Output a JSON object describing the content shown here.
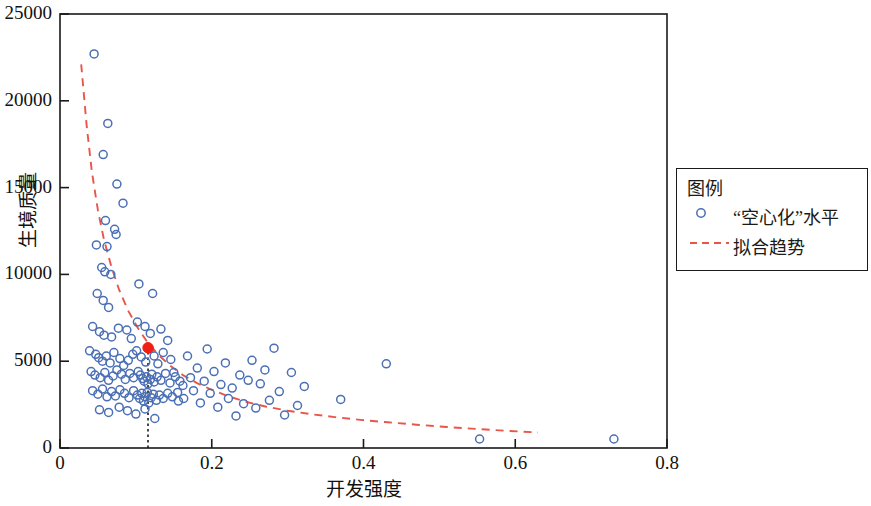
{
  "chart_data": {
    "type": "scatter",
    "title": "",
    "xlabel": "开发强度",
    "ylabel": "生境质量",
    "xlim": [
      0,
      0.8
    ],
    "ylim": [
      0,
      25000
    ],
    "grid": false,
    "xticks": [
      "0",
      "0.2",
      "0.4",
      "0.6",
      "0.8"
    ],
    "xtick_values": [
      0,
      0.2,
      0.4,
      0.6,
      0.8
    ],
    "yticks": [
      "0",
      "5000",
      "10000",
      "15000",
      "20000",
      "25000"
    ],
    "ytick_values": [
      0,
      5000,
      10000,
      15000,
      20000,
      25000
    ],
    "legend": {
      "title": "图例",
      "position": "right-outside",
      "entries": [
        {
          "label": "“空心化”水平",
          "marker": "open-circle",
          "color": "#4a6fb5"
        },
        {
          "label": "拟合趋势",
          "marker": "dashed-line",
          "color": "#e8564a"
        }
      ]
    },
    "series": [
      {
        "name": "“空心化”水平",
        "type": "scatter",
        "marker": "open-circle",
        "color": "#4a6fb5",
        "points": [
          [
            0.045,
            22700
          ],
          [
            0.063,
            18700
          ],
          [
            0.057,
            16900
          ],
          [
            0.075,
            15200
          ],
          [
            0.083,
            14100
          ],
          [
            0.06,
            13100
          ],
          [
            0.072,
            12600
          ],
          [
            0.074,
            12300
          ],
          [
            0.048,
            11700
          ],
          [
            0.062,
            11600
          ],
          [
            0.055,
            10400
          ],
          [
            0.059,
            10150
          ],
          [
            0.067,
            10000
          ],
          [
            0.049,
            8900
          ],
          [
            0.057,
            8500
          ],
          [
            0.064,
            8100
          ],
          [
            0.104,
            9450
          ],
          [
            0.122,
            8900
          ],
          [
            0.043,
            7000
          ],
          [
            0.052,
            6700
          ],
          [
            0.058,
            6500
          ],
          [
            0.068,
            6400
          ],
          [
            0.077,
            6900
          ],
          [
            0.088,
            6800
          ],
          [
            0.094,
            6300
          ],
          [
            0.102,
            7250
          ],
          [
            0.112,
            7000
          ],
          [
            0.119,
            6600
          ],
          [
            0.133,
            6850
          ],
          [
            0.142,
            6200
          ],
          [
            0.039,
            5600
          ],
          [
            0.047,
            5400
          ],
          [
            0.051,
            5200
          ],
          [
            0.056,
            5000
          ],
          [
            0.061,
            5300
          ],
          [
            0.066,
            4900
          ],
          [
            0.071,
            5500
          ],
          [
            0.079,
            5150
          ],
          [
            0.084,
            4750
          ],
          [
            0.09,
            5050
          ],
          [
            0.096,
            5400
          ],
          [
            0.101,
            5600
          ],
          [
            0.107,
            5250
          ],
          [
            0.113,
            4950
          ],
          [
            0.118,
            5700
          ],
          [
            0.124,
            5300
          ],
          [
            0.129,
            4850
          ],
          [
            0.136,
            5500
          ],
          [
            0.146,
            5100
          ],
          [
            0.041,
            4400
          ],
          [
            0.046,
            4200
          ],
          [
            0.053,
            4050
          ],
          [
            0.059,
            4350
          ],
          [
            0.064,
            3900
          ],
          [
            0.07,
            4150
          ],
          [
            0.075,
            4500
          ],
          [
            0.081,
            4250
          ],
          [
            0.086,
            3950
          ],
          [
            0.092,
            4300
          ],
          [
            0.097,
            4050
          ],
          [
            0.103,
            4400
          ],
          [
            0.106,
            4200
          ],
          [
            0.109,
            4000
          ],
          [
            0.111,
            3850
          ],
          [
            0.114,
            4100
          ],
          [
            0.116,
            3700
          ],
          [
            0.119,
            3950
          ],
          [
            0.121,
            4250
          ],
          [
            0.124,
            3800
          ],
          [
            0.128,
            4100
          ],
          [
            0.133,
            3900
          ],
          [
            0.139,
            4300
          ],
          [
            0.145,
            3750
          ],
          [
            0.152,
            4100
          ],
          [
            0.158,
            3850
          ],
          [
            0.043,
            3300
          ],
          [
            0.05,
            3100
          ],
          [
            0.056,
            3400
          ],
          [
            0.062,
            2950
          ],
          [
            0.068,
            3250
          ],
          [
            0.073,
            3000
          ],
          [
            0.079,
            3350
          ],
          [
            0.085,
            3150
          ],
          [
            0.091,
            2900
          ],
          [
            0.097,
            3300
          ],
          [
            0.102,
            3050
          ],
          [
            0.105,
            2850
          ],
          [
            0.108,
            3150
          ],
          [
            0.11,
            2700
          ],
          [
            0.112,
            2950
          ],
          [
            0.115,
            3200
          ],
          [
            0.117,
            2600
          ],
          [
            0.12,
            2900
          ],
          [
            0.123,
            3100
          ],
          [
            0.127,
            2750
          ],
          [
            0.131,
            3050
          ],
          [
            0.136,
            2850
          ],
          [
            0.142,
            3150
          ],
          [
            0.148,
            2950
          ],
          [
            0.155,
            3200
          ],
          [
            0.163,
            2850
          ],
          [
            0.052,
            2200
          ],
          [
            0.064,
            2050
          ],
          [
            0.078,
            2350
          ],
          [
            0.089,
            2150
          ],
          [
            0.1,
            1950
          ],
          [
            0.112,
            2250
          ],
          [
            0.125,
            1700
          ],
          [
            0.15,
            4350
          ],
          [
            0.156,
            2700
          ],
          [
            0.162,
            3600
          ],
          [
            0.168,
            5300
          ],
          [
            0.172,
            4050
          ],
          [
            0.176,
            3300
          ],
          [
            0.181,
            4600
          ],
          [
            0.185,
            2600
          ],
          [
            0.19,
            3850
          ],
          [
            0.194,
            5700
          ],
          [
            0.198,
            3150
          ],
          [
            0.203,
            4400
          ],
          [
            0.208,
            2350
          ],
          [
            0.212,
            3650
          ],
          [
            0.218,
            4900
          ],
          [
            0.222,
            2850
          ],
          [
            0.227,
            3450
          ],
          [
            0.232,
            1850
          ],
          [
            0.237,
            4200
          ],
          [
            0.242,
            2550
          ],
          [
            0.248,
            3900
          ],
          [
            0.253,
            5050
          ],
          [
            0.258,
            2300
          ],
          [
            0.264,
            3700
          ],
          [
            0.27,
            4500
          ],
          [
            0.276,
            2750
          ],
          [
            0.282,
            5750
          ],
          [
            0.289,
            3250
          ],
          [
            0.296,
            1900
          ],
          [
            0.305,
            4350
          ],
          [
            0.313,
            2450
          ],
          [
            0.322,
            3550
          ],
          [
            0.37,
            2800
          ],
          [
            0.43,
            4850
          ],
          [
            0.553,
            520
          ],
          [
            0.73,
            520
          ]
        ]
      },
      {
        "name": "拟合趋势",
        "type": "line",
        "style": "dashed",
        "color": "#e8564a",
        "points": [
          [
            0.028,
            22100
          ],
          [
            0.035,
            18600
          ],
          [
            0.042,
            15900
          ],
          [
            0.05,
            13700
          ],
          [
            0.058,
            12000
          ],
          [
            0.068,
            10400
          ],
          [
            0.078,
            9100
          ],
          [
            0.09,
            7900
          ],
          [
            0.102,
            6950
          ],
          [
            0.115,
            6100
          ],
          [
            0.13,
            5350
          ],
          [
            0.145,
            4750
          ],
          [
            0.162,
            4200
          ],
          [
            0.18,
            3750
          ],
          [
            0.2,
            3350
          ],
          [
            0.222,
            2980
          ],
          [
            0.246,
            2650
          ],
          [
            0.272,
            2380
          ],
          [
            0.3,
            2150
          ],
          [
            0.33,
            1950
          ],
          [
            0.362,
            1780
          ],
          [
            0.396,
            1620
          ],
          [
            0.432,
            1480
          ],
          [
            0.47,
            1340
          ],
          [
            0.51,
            1210
          ],
          [
            0.552,
            1090
          ],
          [
            0.592,
            980
          ],
          [
            0.63,
            900
          ]
        ]
      },
      {
        "name": "标记点",
        "type": "scatter",
        "marker": "filled-circle",
        "color": "#f01e14",
        "points": [
          [
            0.116,
            5780
          ]
        ]
      },
      {
        "name": "参考线",
        "type": "vline",
        "style": "dotted",
        "color": "#1a1a1a",
        "x": 0.116,
        "y_from": 0,
        "y_to": 5780
      }
    ]
  }
}
